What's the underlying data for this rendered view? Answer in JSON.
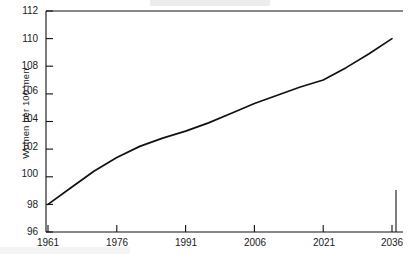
{
  "chart_data": {
    "type": "line",
    "title": "",
    "subtitle": "",
    "xlabel": "",
    "ylabel": "Women per 100 men",
    "x": [
      1961,
      1966,
      1971,
      1976,
      1981,
      1986,
      1991,
      1996,
      2001,
      2006,
      2011,
      2016,
      2021,
      2026,
      2031,
      2036
    ],
    "values": [
      98.0,
      99.2,
      100.4,
      101.4,
      102.2,
      102.8,
      103.3,
      103.9,
      104.6,
      105.3,
      105.9,
      106.5,
      107.0,
      107.9,
      108.9,
      110.0
    ],
    "series": [
      {
        "name": "Women per 100 men",
        "values": [
          98.0,
          99.2,
          100.4,
          101.4,
          102.2,
          102.8,
          103.3,
          103.9,
          104.6,
          105.3,
          105.9,
          106.5,
          107.0,
          107.9,
          108.9,
          110.0
        ]
      }
    ],
    "x_tick_labels": [
      "1961",
      "1976",
      "1991",
      "2006",
      "2021",
      "2036"
    ],
    "x_tick_values": [
      1961,
      1976,
      1991,
      2006,
      2021,
      2036
    ],
    "y_tick_labels": [
      "96",
      "98",
      "100",
      "102",
      "104",
      "106",
      "108",
      "110",
      "112"
    ],
    "y_tick_values": [
      96,
      98,
      100,
      102,
      104,
      106,
      108,
      110,
      112
    ],
    "xlim": [
      1961,
      2036
    ],
    "ylim": [
      96,
      112
    ],
    "grid": false,
    "legend": false,
    "legend_position": "none",
    "line_color": "#111111",
    "axis_color": "#111111",
    "background_color": "#ffffff",
    "annotations": []
  }
}
